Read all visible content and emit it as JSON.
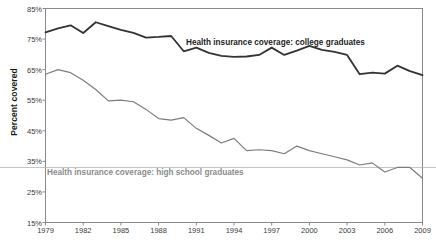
{
  "chart_data": {
    "type": "line",
    "title": "",
    "xlabel": "",
    "ylabel": "Percent covered",
    "xlim": [
      1979,
      2009
    ],
    "ylim": [
      15,
      85
    ],
    "grid": false,
    "legend_position": "inline-annotation",
    "x": [
      1979,
      1980,
      1981,
      1982,
      1983,
      1984,
      1985,
      1986,
      1987,
      1988,
      1989,
      1990,
      1991,
      1992,
      1993,
      1994,
      1995,
      1996,
      1997,
      1998,
      1999,
      2000,
      2001,
      2002,
      2003,
      2004,
      2005,
      2006,
      2007,
      2008,
      2009
    ],
    "xtick_labels": [
      "1979",
      "1982",
      "1985",
      "1988",
      "1991",
      "1994",
      "1997",
      "2000",
      "2003",
      "2006",
      "2009"
    ],
    "xtick_values": [
      1979,
      1982,
      1985,
      1988,
      1991,
      1994,
      1997,
      2000,
      2003,
      2006,
      2009
    ],
    "ytick_labels": [
      "85%",
      "75%",
      "65%",
      "55%",
      "45%",
      "35%",
      "25%",
      "15%"
    ],
    "ytick_values": [
      85,
      75,
      65,
      55,
      45,
      35,
      25,
      15
    ],
    "series": [
      {
        "name": "Health insurance coverage: college graduates",
        "color": "#333333",
        "line_width": 1.8,
        "label_text": "Health insurance coverage: college graduates",
        "values": [
          77.2,
          78.5,
          79.5,
          77.0,
          80.5,
          79.2,
          78.0,
          77.0,
          75.5,
          75.7,
          76.0,
          71.0,
          72.2,
          70.5,
          69.5,
          69.2,
          69.3,
          69.8,
          72.2,
          69.8,
          71.2,
          72.8,
          71.5,
          70.8,
          69.8,
          63.5,
          64.0,
          63.7,
          66.3,
          64.5,
          63.2
        ]
      },
      {
        "name": "Health insurance coverage: high school graduates",
        "color": "#7d7d7d",
        "line_width": 1.2,
        "label_text": "Health insurance coverage: high school graduates",
        "values": [
          63.5,
          65.0,
          64.0,
          61.5,
          58.5,
          54.8,
          55.0,
          54.5,
          52.0,
          49.0,
          48.5,
          49.3,
          45.8,
          43.5,
          41.0,
          42.5,
          38.5,
          38.8,
          38.5,
          37.5,
          40.0,
          38.5,
          37.5,
          36.5,
          35.5,
          33.8,
          34.5,
          31.5,
          33.0,
          33.0,
          29.5
        ]
      }
    ],
    "reference_line": {
      "y": 33.0,
      "color": "#b4b4b4",
      "note": "faint horizontal rule spanning chart near 33%"
    }
  },
  "axes": {
    "y_title": "Percent covered"
  }
}
